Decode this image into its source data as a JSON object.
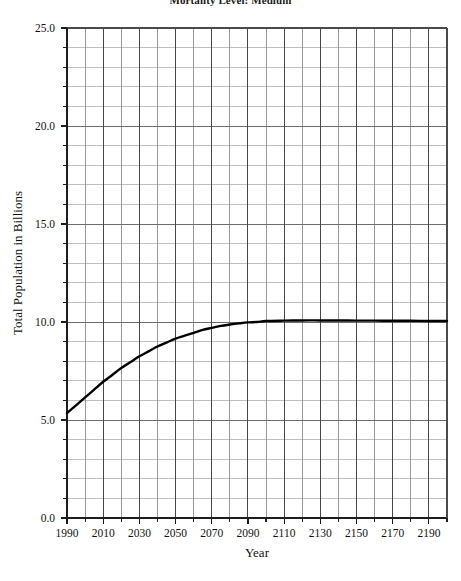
{
  "chart_data": {
    "type": "line",
    "title": "Mortality Level: Medium",
    "xlabel": "Year",
    "ylabel": "Total Population in Billions",
    "xlim": [
      1990,
      2200
    ],
    "ylim": [
      0.0,
      25.0
    ],
    "grid": true,
    "legend": "none",
    "x_major_ticks": [
      1990,
      2010,
      2030,
      2050,
      2070,
      2090,
      2110,
      2130,
      2150,
      2170,
      2190
    ],
    "x_major_tick_labels": [
      "1990",
      "2010",
      "2030",
      "2050",
      "2070",
      "2090",
      "2110",
      "2130",
      "2150",
      "2170",
      "2190"
    ],
    "x_minor_tick_interval": 10,
    "y_major_ticks": [
      0.0,
      5.0,
      10.0,
      15.0,
      20.0,
      25.0
    ],
    "y_major_tick_labels": [
      "0.0",
      "5.0",
      "10.0",
      "15.0",
      "20.0",
      "25.0"
    ],
    "y_minor_tick_interval": 1,
    "series": [
      {
        "name": "Total Population",
        "color": "#000000",
        "line_width": 2.4,
        "x": [
          1990,
          1995,
          2000,
          2005,
          2010,
          2015,
          2020,
          2025,
          2030,
          2035,
          2040,
          2045,
          2050,
          2055,
          2060,
          2065,
          2070,
          2075,
          2080,
          2085,
          2090,
          2095,
          2100,
          2110,
          2120,
          2130,
          2140,
          2150,
          2160,
          2170,
          2180,
          2190,
          2200
        ],
        "values": [
          5.35,
          5.75,
          6.15,
          6.55,
          6.95,
          7.3,
          7.65,
          7.95,
          8.25,
          8.5,
          8.75,
          8.95,
          9.15,
          9.3,
          9.45,
          9.6,
          9.7,
          9.8,
          9.87,
          9.93,
          9.98,
          10.0,
          10.05,
          10.07,
          10.08,
          10.08,
          10.08,
          10.07,
          10.07,
          10.06,
          10.06,
          10.05,
          10.05
        ]
      }
    ]
  }
}
